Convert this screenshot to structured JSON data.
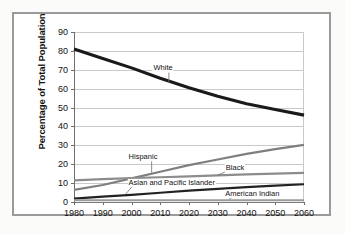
{
  "chart_data": {
    "type": "line",
    "title": "",
    "xlabel": "",
    "ylabel": "Percentage of Total Population",
    "xlim": [
      1980,
      2060
    ],
    "ylim": [
      0,
      90
    ],
    "grid": true,
    "legend_position": "inline-labels",
    "x": [
      1980,
      1990,
      2000,
      2010,
      2020,
      2030,
      2040,
      2050,
      2060
    ],
    "xticks": [
      "1980",
      "1990",
      "2000",
      "2010",
      "2020",
      "2030",
      "2040",
      "2050",
      "2060"
    ],
    "yticks": [
      "0",
      "10",
      "20",
      "30",
      "40",
      "50",
      "60",
      "70",
      "80",
      "90"
    ],
    "series": [
      {
        "name": "White",
        "color": "#1a1a1a",
        "width": 3.1,
        "values": [
          81,
          76,
          71,
          65.5,
          60.5,
          56,
          52,
          49,
          46
        ],
        "label": "White",
        "label_x": 2011,
        "label_y": 71,
        "leader": {
          "x1": 2013,
          "y1": 68.5,
          "x2": 2013,
          "y2": 63.5
        }
      },
      {
        "name": "Hispanic",
        "color": "#7f7f7f",
        "width": 2.2,
        "values": [
          6.4,
          9,
          12.5,
          16,
          19.5,
          22.5,
          25.5,
          28,
          30.2
        ],
        "label": "Hispanic",
        "label_x": 2004,
        "label_y": 24,
        "leader": {
          "x1": 2007,
          "y1": 21.5,
          "x2": 2007,
          "y2": 15.5
        }
      },
      {
        "name": "Black",
        "color": "#8c8c8c",
        "width": 2.2,
        "values": [
          11.5,
          12.1,
          12.6,
          13.1,
          13.6,
          14.1,
          14.6,
          15,
          15.4
        ],
        "label": "Black",
        "label_x": 2036,
        "label_y": 17.8,
        "leader": {
          "x1": 2033,
          "y1": 16.2,
          "x2": 2030,
          "y2": 14.2
        }
      },
      {
        "name": "Asian and Pacific Islander",
        "color": "#222222",
        "width": 2.2,
        "values": [
          1.8,
          2.8,
          3.8,
          4.9,
          6.0,
          7.0,
          7.9,
          8.7,
          9.4
        ],
        "label": "Asian and Pacific Islander",
        "label_x": 2014,
        "label_y": 10.2,
        "leader": {
          "x1": 2001,
          "y1": 9.6,
          "x2": 1998,
          "y2": 4.2
        }
      },
      {
        "name": "American Indian",
        "color": "#9b9b9b",
        "width": 2.0,
        "values": [
          0.9,
          0.9,
          0.9,
          0.9,
          0.9,
          0.9,
          0.9,
          0.9,
          0.9
        ],
        "label": "American Indian",
        "label_x": 2042,
        "label_y": 4.3,
        "leader": {
          "x1": 2036,
          "y1": 3.4,
          "x2": 2034,
          "y2": 1.6
        }
      }
    ]
  }
}
